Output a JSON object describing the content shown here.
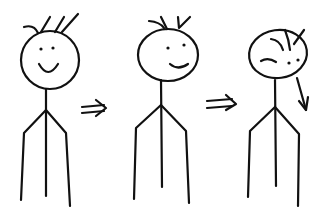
{
  "scene": {
    "description": "Hand-drawn sketch: three stick figures showing progression from happy, to smirking, to a head turned/fallen over",
    "colors": {
      "ink": "#111111",
      "background": "#ffffff"
    },
    "figures": [
      {
        "id": "figure-1",
        "expression": "smile"
      },
      {
        "id": "figure-2",
        "expression": "smirk"
      },
      {
        "id": "figure-3",
        "expression": "head-tilted",
        "annotation": "down-arrow"
      }
    ],
    "arrows": [
      {
        "id": "arrow-1",
        "glyph": "double-right-arrow"
      },
      {
        "id": "arrow-2",
        "glyph": "double-right-arrow"
      }
    ]
  }
}
